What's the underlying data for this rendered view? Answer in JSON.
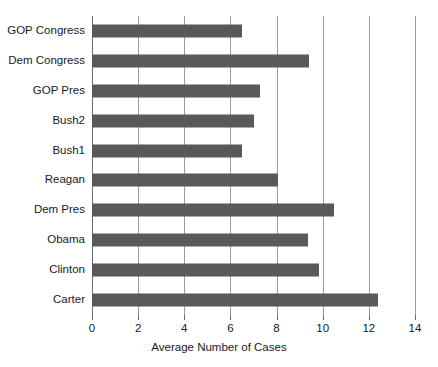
{
  "chart_data": {
    "type": "bar",
    "orientation": "horizontal",
    "title": "",
    "xlabel": "Average Number of Cases",
    "ylabel": "",
    "xlim": [
      0,
      14
    ],
    "xticks": [
      0,
      2,
      4,
      6,
      8,
      10,
      12,
      14
    ],
    "xtick_labels": [
      "0",
      "2",
      "4",
      "6",
      "8",
      "10",
      "12",
      "14"
    ],
    "grid": "vertical",
    "legend": "none",
    "bar_color": "#595959",
    "gridline_color": "#9a9a9a",
    "axis_color": "#6b6b6b",
    "categories": [
      "GOP Congress",
      "Dem Congress",
      "GOP Pres",
      "Bush2",
      "Bush1",
      "Reagan",
      "Dem Pres",
      "Obama",
      "Clinton",
      "Carter"
    ],
    "values": [
      6.5,
      9.4,
      7.3,
      7.0,
      6.5,
      8.05,
      10.5,
      9.35,
      9.85,
      12.4
    ],
    "bars": [
      {
        "label": "GOP Congress",
        "value": 6.5
      },
      {
        "label": "Dem Congress",
        "value": 9.4
      },
      {
        "label": "GOP Pres",
        "value": 7.3
      },
      {
        "label": "Bush2",
        "value": 7.0
      },
      {
        "label": "Bush1",
        "value": 6.5
      },
      {
        "label": "Reagan",
        "value": 8.05
      },
      {
        "label": "Dem Pres",
        "value": 10.5
      },
      {
        "label": "Obama",
        "value": 9.35
      },
      {
        "label": "Clinton",
        "value": 9.85
      },
      {
        "label": "Carter",
        "value": 12.4
      }
    ]
  }
}
